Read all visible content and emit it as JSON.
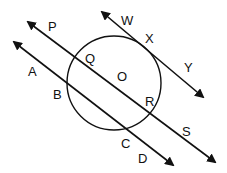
{
  "diagram": {
    "type": "geometry",
    "circle": {
      "center_label": "O",
      "cx": 114,
      "cy": 83,
      "r": 47
    },
    "lines": [
      {
        "name": "tangent",
        "points": [
          "W",
          "X",
          "Y"
        ],
        "x1": 102,
        "y1": 12,
        "x2": 203,
        "y2": 97
      },
      {
        "name": "diameter-secant",
        "points": [
          "P",
          "Q",
          "O",
          "R",
          "S"
        ],
        "x1": 28,
        "y1": 22,
        "x2": 215,
        "y2": 162
      },
      {
        "name": "chord-secant",
        "points": [
          "A",
          "B",
          "C",
          "D"
        ],
        "x1": 14,
        "y1": 42,
        "x2": 173,
        "y2": 165
      }
    ],
    "labels": [
      {
        "text": "P",
        "x": 48,
        "y": 31
      },
      {
        "text": "W",
        "x": 121,
        "y": 25
      },
      {
        "text": "X",
        "x": 145,
        "y": 43
      },
      {
        "text": "Y",
        "x": 184,
        "y": 72
      },
      {
        "text": "Q",
        "x": 85,
        "y": 63
      },
      {
        "text": "O",
        "x": 117,
        "y": 81
      },
      {
        "text": "A",
        "x": 28,
        "y": 76
      },
      {
        "text": "B",
        "x": 53,
        "y": 99
      },
      {
        "text": "R",
        "x": 145,
        "y": 106
      },
      {
        "text": "S",
        "x": 182,
        "y": 136
      },
      {
        "text": "C",
        "x": 121,
        "y": 148
      },
      {
        "text": "D",
        "x": 138,
        "y": 163
      }
    ],
    "stroke_color": "#111111",
    "background": "#ffffff"
  }
}
